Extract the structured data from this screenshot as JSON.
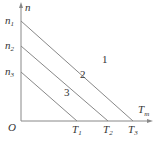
{
  "diagram": {
    "y_axis_label": "n",
    "x_axis_label": "T",
    "x_axis_sub": "m",
    "origin_label": "O",
    "y_ticks": [
      {
        "label": "n",
        "sub": "1"
      },
      {
        "label": "n",
        "sub": "2"
      },
      {
        "label": "n",
        "sub": "3"
      }
    ],
    "x_ticks": [
      {
        "label": "T",
        "sub": "1"
      },
      {
        "label": "T",
        "sub": "2"
      },
      {
        "label": "T",
        "sub": "3"
      }
    ],
    "lines": [
      {
        "label": "1",
        "from": "n1",
        "to": "T3"
      },
      {
        "label": "2",
        "from": "n2",
        "to": "T2"
      },
      {
        "label": "3",
        "from": "n3",
        "to": "T1"
      }
    ],
    "line_color": "#888888"
  }
}
